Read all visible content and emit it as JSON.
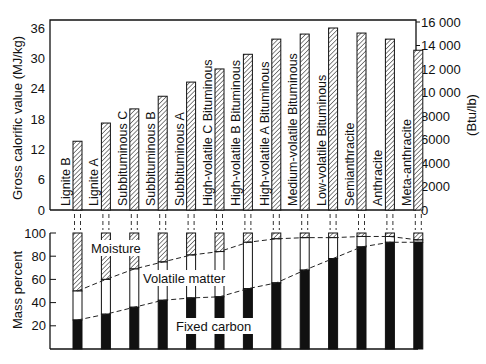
{
  "chart_data": [
    {
      "type": "bar",
      "title": "",
      "categories": [
        "Lignite B",
        "Lignite A",
        "Subbituminous C",
        "Subbituminous B",
        "Subbituminous A",
        "High-volatile C Bituminous",
        "High-volatile B Bituminous",
        "High-volatile A Bituminous",
        "Medium-volatile Bituminous",
        "Low-volatile Bituminous",
        "Semianthracite",
        "Anthracite",
        "Meta-anthracite"
      ],
      "series": [
        {
          "name": "Gross calorific value",
          "values": [
            13.6,
            17.2,
            20.0,
            22.5,
            25.3,
            27.9,
            30.8,
            33.8,
            34.8,
            36.0,
            35.0,
            33.8,
            31.6
          ]
        }
      ],
      "xlabel": "",
      "ylabel": "Gross calorific value (MJ/kg)",
      "ylim": [
        0,
        36
      ],
      "yticks": [
        0,
        6,
        12,
        18,
        24,
        30,
        36
      ],
      "y2label": "(Btu/lb)",
      "y2lim": [
        0,
        16000
      ],
      "y2ticks": [
        "0",
        "2000",
        "4000",
        "6000",
        "8000",
        "10 000",
        "12 000",
        "14 000",
        "16 000"
      ],
      "grid": false,
      "bar_fill": "hatched"
    },
    {
      "type": "bar",
      "stacked": true,
      "title": "",
      "categories": [
        "Lignite B",
        "Lignite A",
        "Subbituminous C",
        "Subbituminous B",
        "Subbituminous A",
        "High-volatile C Bituminous",
        "High-volatile B Bituminous",
        "High-volatile A Bituminous",
        "Medium-volatile Bituminous",
        "Low-volatile Bituminous",
        "Semianthracite",
        "Anthracite",
        "Meta-anthracite"
      ],
      "series": [
        {
          "name": "Fixed carbon",
          "fill": "solid black",
          "values": [
            25,
            30,
            36,
            42,
            44,
            45,
            52,
            57,
            68,
            78,
            88,
            92,
            92
          ]
        },
        {
          "name": "Volatile matter",
          "fill": "white",
          "values": [
            25,
            30,
            33,
            33,
            37,
            39,
            40,
            38,
            28,
            18,
            9,
            5,
            2
          ]
        },
        {
          "name": "Moisture",
          "fill": "hatched",
          "values": [
            50,
            40,
            31,
            25,
            19,
            16,
            8,
            5,
            4,
            4,
            3,
            3,
            6
          ]
        }
      ],
      "xlabel": "",
      "ylabel": "Mass percent",
      "ylim": [
        0,
        100
      ],
      "yticks": [
        20,
        40,
        60,
        80,
        100
      ],
      "annotations": [
        "Moisture",
        "Volatile matter",
        "Fixed carbon"
      ],
      "dashed_boundary_lines": [
        "fixed carbon / volatile matter",
        "volatile matter / moisture"
      ],
      "grid": false
    }
  ],
  "labels": {
    "top_ylabel": "Gross calorific value (MJ/kg)",
    "top_y2label": "(Btu/lb)",
    "bottom_ylabel": "Mass percent",
    "moisture": "Moisture",
    "volatile": "Volatile matter",
    "fixed_carbon": "Fixed carbon"
  }
}
